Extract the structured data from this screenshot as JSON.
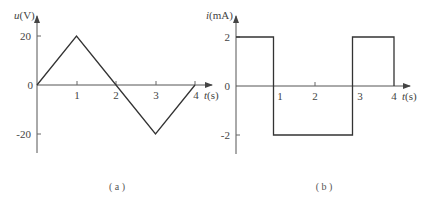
{
  "chart_data": [
    {
      "id": "a",
      "type": "line",
      "title": "",
      "caption": "( a )",
      "ylabel_var": "u",
      "ylabel_unit": "(V)",
      "xlabel_var": "t",
      "xlabel_unit": "(s)",
      "x": [
        0,
        1,
        2,
        3,
        4
      ],
      "values": [
        0,
        20,
        0,
        -20,
        0
      ],
      "xticks": [
        "1",
        "2",
        "3",
        "4"
      ],
      "yticks": [
        "20",
        "0",
        "-20"
      ],
      "xlim": [
        0,
        4.4
      ],
      "ylim": [
        -28,
        28
      ],
      "grid": false,
      "waveform": "triangle"
    },
    {
      "id": "b",
      "type": "line",
      "title": "",
      "caption": "( b )",
      "ylabel_var": "i",
      "ylabel_unit": "(mA)",
      "xlabel_var": "t",
      "xlabel_unit": "(s)",
      "x": [
        0,
        0.95,
        0.95,
        2.95,
        2.95,
        4,
        4
      ],
      "values": [
        2,
        2,
        -2,
        -2,
        2,
        2,
        0
      ],
      "xticks": [
        "1",
        "2",
        "3",
        "4"
      ],
      "yticks": [
        "2",
        "0",
        "-2"
      ],
      "xlim": [
        0,
        4.4
      ],
      "ylim": [
        -2.8,
        2.8
      ],
      "grid": false,
      "waveform": "square"
    }
  ]
}
